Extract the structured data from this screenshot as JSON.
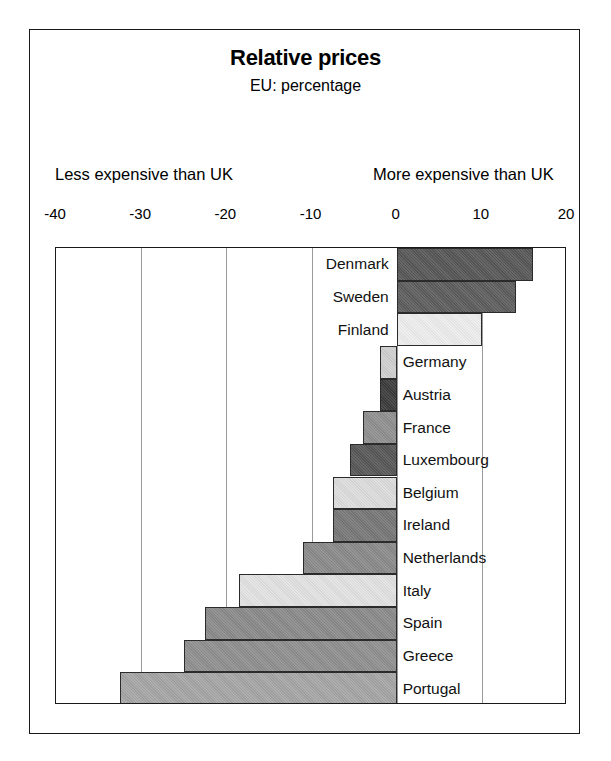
{
  "chart_data": {
    "type": "bar",
    "orientation": "horizontal",
    "title": "Relative prices",
    "subtitle": "EU: percentage",
    "xlabel": "",
    "ylabel": "",
    "xlim": [
      -40,
      20
    ],
    "grid": true,
    "gridlines": [
      -40,
      -30,
      -20,
      -10,
      0,
      10,
      20
    ],
    "tick_labels": [
      "-40",
      "-30",
      "-20",
      "-10",
      "0",
      "10",
      "20"
    ],
    "left_annotation": "Less expensive than UK",
    "right_annotation": "More expensive than UK",
    "legend": "none",
    "categories": [
      "Denmark",
      "Sweden",
      "Finland",
      "Germany",
      "Austria",
      "France",
      "Luxembourg",
      "Belgium",
      "Ireland",
      "Netherlands",
      "Italy",
      "Spain",
      "Greece",
      "Portugal"
    ],
    "values": [
      16,
      14,
      10,
      -2,
      -2,
      -4,
      -5.5,
      -7.5,
      -7.5,
      -11,
      -18.5,
      -22.5,
      -25,
      -32.5
    ],
    "bars": [
      {
        "label": "Denmark",
        "value": 16,
        "color": "#575757",
        "label_side": "left"
      },
      {
        "label": "Sweden",
        "value": 14,
        "color": "#5d5d5d",
        "label_side": "left"
      },
      {
        "label": "Finland",
        "value": 10,
        "color": "#ededed",
        "label_side": "left"
      },
      {
        "label": "Germany",
        "value": -2,
        "color": "#cfcfcf",
        "label_side": "right"
      },
      {
        "label": "Austria",
        "value": -2,
        "color": "#3b3b3b",
        "label_side": "right"
      },
      {
        "label": "France",
        "value": -4,
        "color": "#8f8f8f",
        "label_side": "right"
      },
      {
        "label": "Luxembourg",
        "value": -5.5,
        "color": "#575757",
        "label_side": "right"
      },
      {
        "label": "Belgium",
        "value": -7.5,
        "color": "#dcdcdc",
        "label_side": "right"
      },
      {
        "label": "Ireland",
        "value": -7.5,
        "color": "#777777",
        "label_side": "right"
      },
      {
        "label": "Netherlands",
        "value": -11,
        "color": "#8a8a8a",
        "label_side": "right"
      },
      {
        "label": "Italy",
        "value": -18.5,
        "color": "#e2e2e2",
        "label_side": "right"
      },
      {
        "label": "Spain",
        "value": -22.5,
        "color": "#8a8a8a",
        "label_side": "right"
      },
      {
        "label": "Greece",
        "value": -25,
        "color": "#8f8f8f",
        "label_side": "right"
      },
      {
        "label": "Portugal",
        "value": -32.5,
        "color": "#a5a5a5",
        "label_side": "right"
      }
    ]
  }
}
